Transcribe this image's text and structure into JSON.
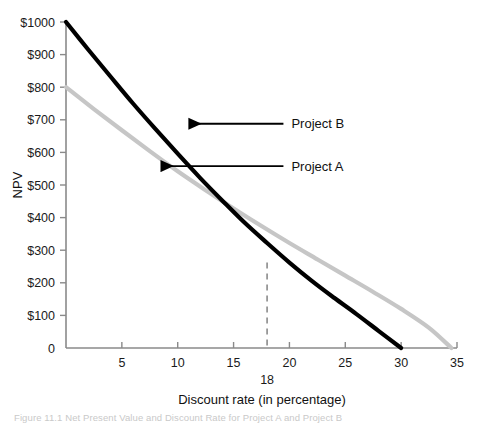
{
  "figure": {
    "caption": "Figure 11.1  Net Present Value and Discount Rate for Project A and Project B"
  },
  "chart_data": {
    "type": "line",
    "title": "",
    "xlabel": "Discount rate (in percentage)",
    "ylabel": "NPV",
    "xlim": [
      0,
      35
    ],
    "ylim": [
      0,
      1000
    ],
    "grid": false,
    "legend_position": "inline-annotations",
    "xticks": [
      5,
      10,
      15,
      20,
      25,
      30,
      35
    ],
    "xtick_labels": [
      "5",
      "10",
      "15",
      "20",
      "25",
      "30",
      "35"
    ],
    "yticks": [
      0,
      100,
      200,
      300,
      400,
      500,
      600,
      700,
      800,
      900,
      1000
    ],
    "ytick_labels": [
      "0",
      "$100",
      "$200",
      "$300",
      "$400",
      "$500",
      "$600",
      "$700",
      "$800",
      "$900",
      "$1000"
    ],
    "series": [
      {
        "name": "Project B",
        "color": "#000000",
        "width": 4.2,
        "label": "Project B",
        "x": [
          0,
          2,
          4,
          6,
          8,
          10,
          12,
          14,
          16,
          18,
          20,
          22,
          24,
          26,
          28,
          30
        ],
        "values": [
          1000,
          915,
          832,
          750,
          672,
          596,
          522,
          452,
          384,
          322,
          262,
          206,
          154,
          104,
          52,
          0
        ]
      },
      {
        "name": "Project A",
        "color": "#c6c6c6",
        "width": 4.2,
        "label": "Project A",
        "x": [
          0,
          2.5,
          5,
          7.5,
          10,
          12.5,
          15,
          17.5,
          20,
          22.5,
          25,
          27.5,
          30,
          32.5,
          34.5
        ],
        "values": [
          800,
          733,
          668,
          604,
          542,
          484,
          428,
          374,
          322,
          272,
          222,
          172,
          120,
          62,
          0
        ]
      }
    ],
    "annotations": [
      {
        "name": "project-b-callout",
        "text": "Project B",
        "label_x": 20.0,
        "label_y": 688,
        "arrow_tip_x": 10.5,
        "arrow_tip_y": 688
      },
      {
        "name": "project-a-callout",
        "text": "Project A",
        "label_x": 20.0,
        "label_y": 558,
        "arrow_tip_x": 8.0,
        "arrow_tip_y": 558
      }
    ],
    "markers": [
      {
        "name": "crossover-rate",
        "label": "18",
        "x": 18,
        "y_from": 262,
        "y_to": 0,
        "style": "dashed",
        "color": "#8a8a8a"
      }
    ]
  }
}
